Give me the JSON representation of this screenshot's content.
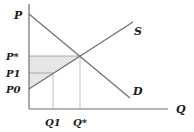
{
  "diagram": {
    "type": "supply-demand",
    "axes": {
      "y_label": "P",
      "x_label": "Q"
    },
    "curves": [
      {
        "name": "supply",
        "label": "S"
      },
      {
        "name": "demand",
        "label": "D"
      }
    ],
    "price_labels": {
      "p_star": "P*",
      "p1": "P1",
      "p0": "P0"
    },
    "quantity_labels": {
      "q1": "Q1",
      "q_star": "Q*"
    },
    "colors": {
      "line": "#6e6e6e",
      "axis": "#6e6e6e",
      "shade": "#e6e6e6",
      "guide": "#b0b0b0",
      "text": "#1a1a1a"
    }
  }
}
